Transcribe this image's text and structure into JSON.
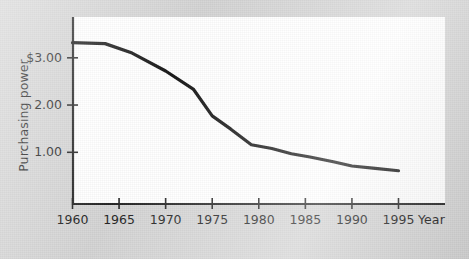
{
  "chart_data": {
    "type": "line",
    "title": "",
    "subtitle": "",
    "xlabel": "Year",
    "ylabel": "Purchasing power",
    "xlim": [
      1960,
      1998.5
    ],
    "ylim": [
      0.15,
      3.55
    ],
    "grid": false,
    "legend": null,
    "x_ticks": [
      1960,
      1965,
      1970,
      1975,
      1980,
      1985,
      1990,
      1995
    ],
    "x_tick_labels": [
      "1960",
      "1965",
      "1970",
      "1975",
      "1980",
      "1985",
      "1990",
      "1995"
    ],
    "y_ticks": [
      3.0,
      2.0,
      1.0
    ],
    "y_tick_labels": [
      "$3.00",
      "2.00",
      "1.00"
    ],
    "line_color": "#161616",
    "line_width": 3.2,
    "plot_bg": "#ffffff",
    "figure_bg": "#d4d4d4",
    "series": [
      {
        "name": "Purchasing power of the dollar",
        "x": [
          1960,
          1963.5,
          1966.4,
          1970,
          1973.0,
          1975.0,
          1977.0,
          1979.2,
          1981.4,
          1983.5,
          1985.5,
          1988.0,
          1990.0,
          1992.5,
          1995.0
        ],
        "values": [
          3.32,
          3.3,
          3.1,
          2.72,
          2.33,
          1.77,
          1.49,
          1.16,
          1.08,
          0.97,
          0.9,
          0.8,
          0.71,
          0.66,
          0.61
        ]
      }
    ]
  },
  "labels": {
    "y_axis_title": "Purchasing power",
    "x_axis_title": "Year"
  }
}
